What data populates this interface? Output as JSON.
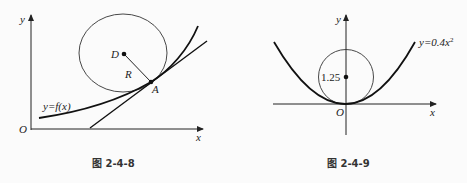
{
  "figures": [
    {
      "id": "left",
      "caption": "图 2-4-8",
      "labels": {
        "origin": "O",
        "x_axis": "x",
        "y_axis": "y",
        "center": "D",
        "radius": "R",
        "point": "A",
        "curve": "y=f(x)"
      },
      "colors": {
        "stroke": "#222222",
        "background": "#fbfbfb"
      }
    },
    {
      "id": "right",
      "caption": "图 2-4-9",
      "labels": {
        "origin": "O",
        "x_axis": "x",
        "y_axis": "y",
        "center_value": "1.25",
        "curve": "y=0.4x",
        "curve_exp": "2"
      },
      "colors": {
        "stroke": "#222222",
        "background": "#fbfbfb"
      }
    }
  ]
}
